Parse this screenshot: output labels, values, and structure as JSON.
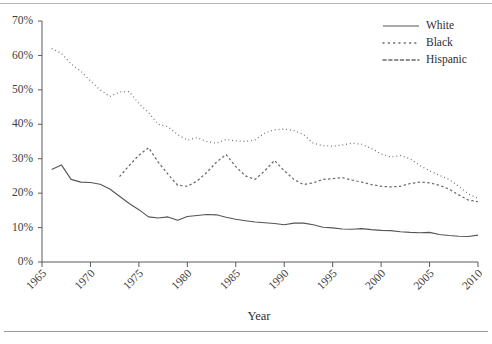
{
  "chart_data": {
    "type": "line",
    "title": "",
    "xlabel": "Year",
    "ylabel": "",
    "xlim": [
      1965,
      2010
    ],
    "ylim": [
      0,
      70
    ],
    "grid": false,
    "legend_position": "top-right",
    "y_ticks": [
      0,
      10,
      20,
      30,
      40,
      50,
      60,
      70
    ],
    "y_tick_labels": [
      "0%",
      "10%",
      "20%",
      "30%",
      "40%",
      "50%",
      "60%",
      "70%"
    ],
    "x_ticks": [
      1965,
      1970,
      1975,
      1980,
      1985,
      1990,
      1995,
      2000,
      2005,
      2010
    ],
    "x_tick_labels": [
      "1965",
      "1970",
      "1975",
      "1980",
      "1985",
      "1990",
      "1995",
      "2000",
      "2005",
      "2010"
    ],
    "series": [
      {
        "name": "White",
        "style": "solid",
        "color": "#555555",
        "x": [
          1966,
          1967,
          1968,
          1969,
          1970,
          1971,
          1972,
          1973,
          1974,
          1975,
          1976,
          1977,
          1978,
          1979,
          1980,
          1981,
          1982,
          1983,
          1984,
          1985,
          1986,
          1987,
          1988,
          1989,
          1990,
          1991,
          1992,
          1993,
          1994,
          1995,
          1996,
          1997,
          1998,
          1999,
          2000,
          2001,
          2002,
          2003,
          2004,
          2005,
          2006,
          2007,
          2008,
          2009,
          2010
        ],
        "values": [
          26.9,
          28.2,
          24.0,
          23.2,
          23.1,
          22.6,
          21.2,
          19.1,
          17.0,
          15.2,
          13.1,
          12.8,
          13.1,
          12.1,
          13.2,
          13.5,
          13.8,
          13.7,
          13.0,
          12.4,
          12.0,
          11.6,
          11.4,
          11.2,
          10.8,
          11.3,
          11.3,
          10.8,
          10.1,
          9.9,
          9.6,
          9.5,
          9.7,
          9.4,
          9.2,
          9.1,
          8.8,
          8.6,
          8.5,
          8.6,
          8.0,
          7.7,
          7.5,
          7.4,
          7.8
        ]
      },
      {
        "name": "Black",
        "style": "dotted",
        "color": "#6a6a6a",
        "x": [
          1966,
          1967,
          1968,
          1969,
          1970,
          1971,
          1972,
          1973,
          1974,
          1975,
          1976,
          1977,
          1978,
          1979,
          1980,
          1981,
          1982,
          1983,
          1984,
          1985,
          1986,
          1987,
          1988,
          1989,
          1990,
          1991,
          1992,
          1993,
          1994,
          1995,
          1996,
          1997,
          1998,
          1999,
          2000,
          2001,
          2002,
          2003,
          2004,
          2005,
          2006,
          2007,
          2008,
          2009,
          2010
        ],
        "values": [
          62.0,
          60.6,
          57.6,
          55.4,
          52.6,
          50.0,
          48.1,
          49.4,
          49.5,
          46.0,
          43.4,
          40.0,
          39.3,
          37.0,
          35.4,
          36.1,
          35.0,
          34.5,
          35.6,
          35.2,
          35.0,
          35.5,
          37.5,
          38.4,
          38.6,
          38.2,
          37.0,
          34.5,
          33.8,
          33.6,
          34.0,
          34.5,
          34.2,
          33.0,
          31.4,
          30.5,
          30.9,
          30.0,
          28.0,
          26.5,
          25.2,
          24.0,
          22.0,
          19.8,
          18.5
        ]
      },
      {
        "name": "Hispanic",
        "style": "dashed",
        "color": "#6a6a6a",
        "x": [
          1973,
          1974,
          1975,
          1976,
          1977,
          1978,
          1979,
          1980,
          1981,
          1982,
          1983,
          1984,
          1985,
          1986,
          1987,
          1988,
          1989,
          1990,
          1991,
          1992,
          1993,
          1994,
          1995,
          1996,
          1997,
          1998,
          1999,
          2000,
          2001,
          2002,
          2003,
          2004,
          2005,
          2006,
          2007,
          2008,
          2009,
          2010
        ],
        "values": [
          24.8,
          28.0,
          31.0,
          33.2,
          29.0,
          25.5,
          22.3,
          22.0,
          23.5,
          26.0,
          29.0,
          31.2,
          27.7,
          25.0,
          24.0,
          26.5,
          29.5,
          26.5,
          24.0,
          22.5,
          23.0,
          24.0,
          24.2,
          24.5,
          23.8,
          23.2,
          22.5,
          22.0,
          21.8,
          22.0,
          22.8,
          23.2,
          23.0,
          22.3,
          21.2,
          19.5,
          18.0,
          17.5
        ]
      }
    ]
  },
  "axis": {
    "x_title": "Year"
  },
  "legend": {
    "items": [
      {
        "label": "White",
        "style": "solid"
      },
      {
        "label": "Black",
        "style": "dotted"
      },
      {
        "label": "Hispanic",
        "style": "dashed"
      }
    ]
  }
}
